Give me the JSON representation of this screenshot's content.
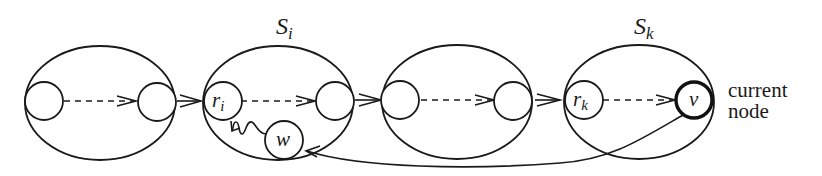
{
  "diagram": {
    "type": "component-chain",
    "sets": [
      {
        "id": "set-1",
        "label": ""
      },
      {
        "id": "set-i",
        "label": "S",
        "subscript": "i"
      },
      {
        "id": "set-3",
        "label": ""
      },
      {
        "id": "set-k",
        "label": "S",
        "subscript": "k"
      }
    ],
    "nodes": {
      "r_i": {
        "label": "r",
        "subscript": "i"
      },
      "w": {
        "label": "w"
      },
      "r_k": {
        "label": "r",
        "subscript": "k"
      },
      "v": {
        "label": "v"
      }
    },
    "annotation": {
      "line1": "current",
      "line2": "node"
    },
    "edges": [
      {
        "from": "set-1.left",
        "to": "set-1.right",
        "style": "dashed"
      },
      {
        "from": "set-1.right",
        "to": "r_i",
        "style": "solid-arrow"
      },
      {
        "from": "r_i",
        "to": "set-i.right",
        "style": "dashed"
      },
      {
        "from": "set-i.right",
        "to": "set-3.left",
        "style": "solid-arrow"
      },
      {
        "from": "set-3.left",
        "to": "set-3.right",
        "style": "dashed"
      },
      {
        "from": "set-3.right",
        "to": "r_k",
        "style": "solid-arrow"
      },
      {
        "from": "r_k",
        "to": "v",
        "style": "dashed"
      },
      {
        "from": "v",
        "to": "w",
        "style": "curved-arrow"
      },
      {
        "from": "w",
        "to": "r_i",
        "style": "wavy-path"
      }
    ],
    "colors": {
      "stroke": "#1a1a1a",
      "background": "#ffffff"
    }
  }
}
